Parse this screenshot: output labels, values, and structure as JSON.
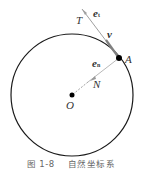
{
  "figure": {
    "labels": {
      "T": "T",
      "et": "e",
      "et_sub": "t",
      "v": "v",
      "A": "A",
      "en": "e",
      "en_sub": "n",
      "N": "N",
      "O": "O"
    },
    "caption": {
      "number": "图 1-8",
      "title": "自然坐标系"
    },
    "colors": {
      "circle": "#1a1a1a",
      "vectors": "#999999",
      "points": "#000000"
    }
  }
}
